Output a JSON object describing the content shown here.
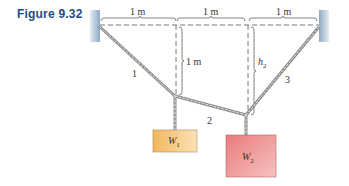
{
  "figure": {
    "label": "Figure 9.32",
    "spans": [
      {
        "id": "span-1",
        "text": "1 m"
      },
      {
        "id": "span-2",
        "text": "1 m"
      },
      {
        "id": "span-3",
        "text": "1 m"
      }
    ],
    "vertical_dims": [
      {
        "id": "drop-1",
        "text": "1 m"
      },
      {
        "id": "drop-2",
        "text": "h",
        "subscript": "2"
      }
    ],
    "cables": [
      {
        "id": "cable-1",
        "label": "1"
      },
      {
        "id": "cable-2",
        "label": "2"
      },
      {
        "id": "cable-3",
        "label": "3"
      }
    ],
    "weights": [
      {
        "id": "weight-1",
        "symbol": "W",
        "subscript": "1",
        "color": "#f5c77a"
      },
      {
        "id": "weight-2",
        "symbol": "W",
        "subscript": "2",
        "color": "#ee8d8d"
      }
    ],
    "colors": {
      "label_blue": "#1a4d8c",
      "wall": "#a8bfd6",
      "dash": "#777777",
      "rope": "#999999"
    }
  }
}
